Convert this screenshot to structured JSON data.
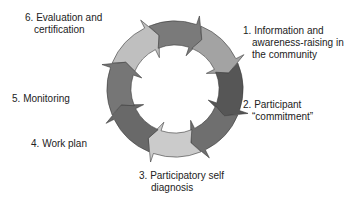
{
  "diagram": {
    "type": "cycle",
    "steps": [
      {
        "number": "1.",
        "line1": "Information and",
        "line2": "awareness-raising in",
        "line3": "the community"
      },
      {
        "number": "2.",
        "line1": "Participant",
        "line2": "“commitment”"
      },
      {
        "number": "3.",
        "line1": "Participatory self",
        "line2": "diagnosis"
      },
      {
        "number": "4.",
        "line1": "Work plan"
      },
      {
        "number": "5.",
        "line1": "Monitoring"
      },
      {
        "number": "6.",
        "line1": "Evaluation and",
        "line2": "certification"
      }
    ],
    "segment_colors": [
      "#bfbfbf",
      "#7a7a7a",
      "#a3a3a3",
      "#565656",
      "#6f6f6f",
      "#cbcbcb",
      "#696969",
      "#767676"
    ]
  }
}
